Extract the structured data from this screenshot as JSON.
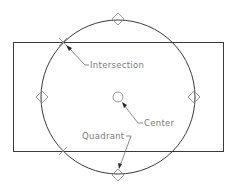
{
  "diagram": {
    "type": "cad-object-snap-illustration",
    "shapes": {
      "rectangle": {
        "x": 13,
        "y": 42,
        "width": 210,
        "height": 109
      },
      "circle": {
        "cx": 118,
        "cy": 97,
        "r": 77
      },
      "center_marker": {
        "cx": 118,
        "cy": 97,
        "r": 5
      }
    },
    "snap_markers": {
      "quadrant_diamonds": [
        {
          "name": "top",
          "cx": 118,
          "cy": 19
        },
        {
          "name": "bottom",
          "cx": 118,
          "cy": 175
        },
        {
          "name": "left",
          "cx": 42,
          "cy": 97
        },
        {
          "name": "right",
          "cx": 194,
          "cy": 97
        }
      ],
      "intersection_marks": [
        {
          "name": "top-left",
          "x": 63,
          "y": 42
        },
        {
          "name": "bottom-left",
          "x": 63,
          "y": 151
        }
      ]
    },
    "labels": {
      "intersection": "Intersection",
      "center": "Center",
      "quadrant": "Quadrant"
    },
    "colors": {
      "geometry": "#3a3a3a",
      "markers": "#8a8a8a",
      "leaders": "#6a6a6a",
      "text": "#7a7a7a",
      "background": "#ffffff"
    }
  }
}
